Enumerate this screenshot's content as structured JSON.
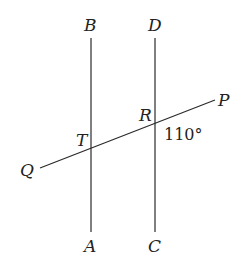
{
  "diagram": {
    "type": "parallel-lines-transversal",
    "lines": [
      {
        "name": "AB",
        "top_label": "B",
        "bottom_label": "A"
      },
      {
        "name": "CD",
        "top_label": "D",
        "bottom_label": "C"
      },
      {
        "name": "QP",
        "left_label": "Q",
        "right_label": "P"
      }
    ],
    "intersections": [
      {
        "label": "T",
        "lines": [
          "AB",
          "QP"
        ]
      },
      {
        "label": "R",
        "lines": [
          "CD",
          "QP"
        ]
      }
    ],
    "angle": {
      "at": "R",
      "value": "110°"
    },
    "labels": {
      "B": "B",
      "D": "D",
      "A": "A",
      "C": "C",
      "P": "P",
      "Q": "Q",
      "T": "T",
      "R": "R",
      "angle_R": "110°"
    },
    "colors": {
      "line": "#2a2a2a",
      "text": "#222222",
      "background": "#ffffff"
    }
  }
}
